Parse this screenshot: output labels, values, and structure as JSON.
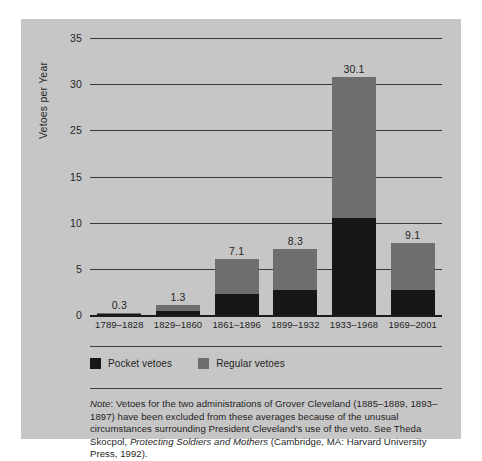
{
  "chart_data": {
    "type": "bar",
    "subtype": "stacked-bar",
    "title": "",
    "xlabel": "",
    "ylabel": "Vetoes per Year",
    "ylim": [
      0,
      35
    ],
    "yticks": [
      35,
      30,
      25,
      15,
      10,
      5,
      0
    ],
    "ytick_labels": [
      "35",
      "30",
      "25",
      "15",
      "10",
      "5",
      "0"
    ],
    "grid": true,
    "legend_position": "below-axis",
    "categories": [
      "1789–1828",
      "1829–1860",
      "1861–1896",
      "1899–1932",
      "1933–1968",
      "1969–2001"
    ],
    "series": [
      {
        "name": "Pocket vetoes",
        "color": "#171717",
        "values": [
          0.1,
          0.5,
          2.7,
          3.2,
          12.3,
          3.2
        ]
      },
      {
        "name": "Regular vetoes",
        "color": "#6e6e6e",
        "values": [
          0.2,
          0.8,
          4.4,
          5.1,
          17.8,
          5.9
        ]
      }
    ],
    "totals": [
      0.3,
      1.3,
      7.1,
      8.3,
      30.1,
      9.1
    ],
    "total_labels": [
      "0.3",
      "1.3",
      "7.1",
      "8.3",
      "30.1",
      "9.1"
    ]
  },
  "legend": {
    "items": [
      {
        "label": "Pocket vetoes",
        "color": "#171717",
        "swatch": "pocket"
      },
      {
        "label": "Regular vetoes",
        "color": "#6e6e6e",
        "swatch": "regular"
      }
    ]
  },
  "note": {
    "prefix": "Note",
    "line1_a": ": Vetoes for the two administrations of Grover Cleveland (1885–1889, 1893–1897) have been excluded from these averages because of the unusual circumstances surrounding President Cleveland’s use of the veto. See Theda Skocpol, ",
    "title_italic": "Protecting Soldiers and Mothers",
    "line1_b": " (Cambridge, MA: Harvard University Press, 1992)."
  },
  "colors": {
    "panel_background": "#c6c6c6",
    "page_background": "#ffffff",
    "pocket": "#171717",
    "regular": "#6e6e6e",
    "gridline": "#3a3a3a",
    "text": "#1f1f1f"
  }
}
